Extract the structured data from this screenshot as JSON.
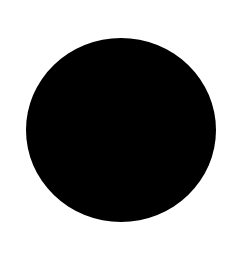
{
  "canvas": {
    "background": "#ffffff",
    "width": 238,
    "height": 268
  },
  "shape": {
    "type": "filled-circle",
    "fill": "#000000",
    "center": [
      121,
      130
    ],
    "width": 190,
    "height": 184
  }
}
